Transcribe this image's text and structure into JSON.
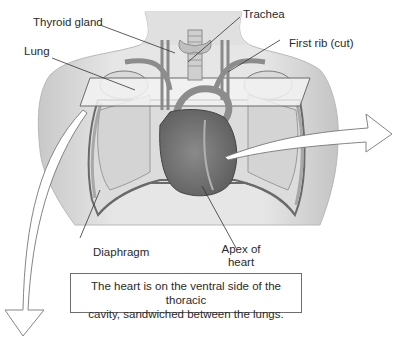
{
  "figure": {
    "labels": {
      "thyroid_gland": "Thyroid gland",
      "trachea": "Trachea",
      "lung": "Lung",
      "first_rib": "First rib (cut)",
      "diaphragm": "Diaphragm",
      "apex_line1": "Apex of",
      "apex_line2": "heart"
    },
    "caption": {
      "line1": "The heart is on the ventral side of the thoracic",
      "line2": "cavity, sandwiched between the lungs."
    },
    "colors": {
      "skin": "#e4e4e4",
      "skin_shadow": "#c9c9c9",
      "lung": "#d8d8d8",
      "heart": "#7a7a7a",
      "vessel": "#9a9a9a",
      "outline": "#555555"
    }
  }
}
